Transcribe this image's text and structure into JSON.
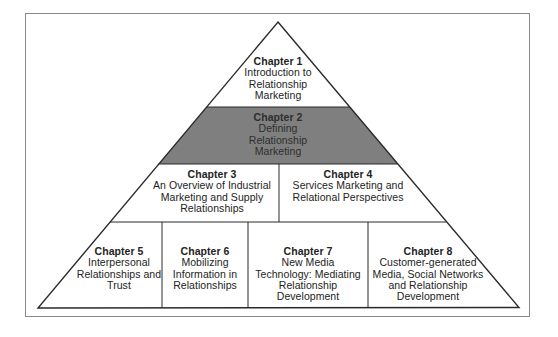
{
  "diagram": {
    "type": "pyramid",
    "colors": {
      "frame_border": "#8a8a8a",
      "outline": "#2a2a2a",
      "highlight_fill": "#7f7f7f",
      "default_fill": "#ffffff",
      "text": "#232323"
    },
    "levels": [
      {
        "level": 1,
        "chapters": [
          {
            "title": "Chapter 1",
            "body": "Introduction to\nRelationship\nMarketing",
            "highlighted": false
          }
        ]
      },
      {
        "level": 2,
        "chapters": [
          {
            "title": "Chapter 2",
            "body": "Defining\nRelationship\nMarketing",
            "highlighted": true
          }
        ]
      },
      {
        "level": 3,
        "chapters": [
          {
            "title": "Chapter 3",
            "body": "An Overview of Industrial\nMarketing and Supply\nRelationships",
            "highlighted": false
          },
          {
            "title": "Chapter 4",
            "body": "Services Marketing and\nRelational Perspectives",
            "highlighted": false
          }
        ]
      },
      {
        "level": 4,
        "chapters": [
          {
            "title": "Chapter 5",
            "body": "Interpersonal\nRelationships and\nTrust",
            "highlighted": false
          },
          {
            "title": "Chapter 6",
            "body": "Mobilizing\nInformation in\nRelationships",
            "highlighted": false
          },
          {
            "title": "Chapter 7",
            "body": "New Media\nTechnology: Mediating\nRelationship\nDevelopment",
            "highlighted": false
          },
          {
            "title": "Chapter 8",
            "body": "Customer-generated\nMedia, Social Networks\nand Relationship\nDevelopment",
            "highlighted": false
          }
        ]
      }
    ]
  }
}
